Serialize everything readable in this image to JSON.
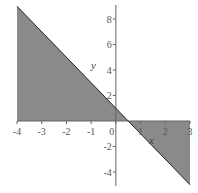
{
  "chart_data": {
    "type": "area",
    "title": "",
    "xlabel": "x",
    "ylabel": "y",
    "xlim": [
      -4,
      3
    ],
    "ylim": [
      -5,
      9
    ],
    "grid": false,
    "legend": null,
    "function": "y = 1 - 2x",
    "series": [
      {
        "name": "y = 1 - 2x (shaded to x-axis)",
        "x": [
          -4,
          -3,
          -2,
          -1,
          0,
          0.5,
          1,
          2,
          3
        ],
        "values": [
          9,
          7,
          5,
          3,
          1,
          0,
          -1,
          -3,
          -5
        ]
      }
    ],
    "x_ticks": [
      "-4",
      "-3",
      "-2",
      "-1",
      "0",
      "1",
      "2",
      "3"
    ],
    "y_ticks": [
      "-4",
      "-2",
      "2",
      "4",
      "6",
      "8"
    ],
    "fill_color": "#8a8a8a",
    "line_color": "#222222",
    "axis_color": "#666666"
  }
}
